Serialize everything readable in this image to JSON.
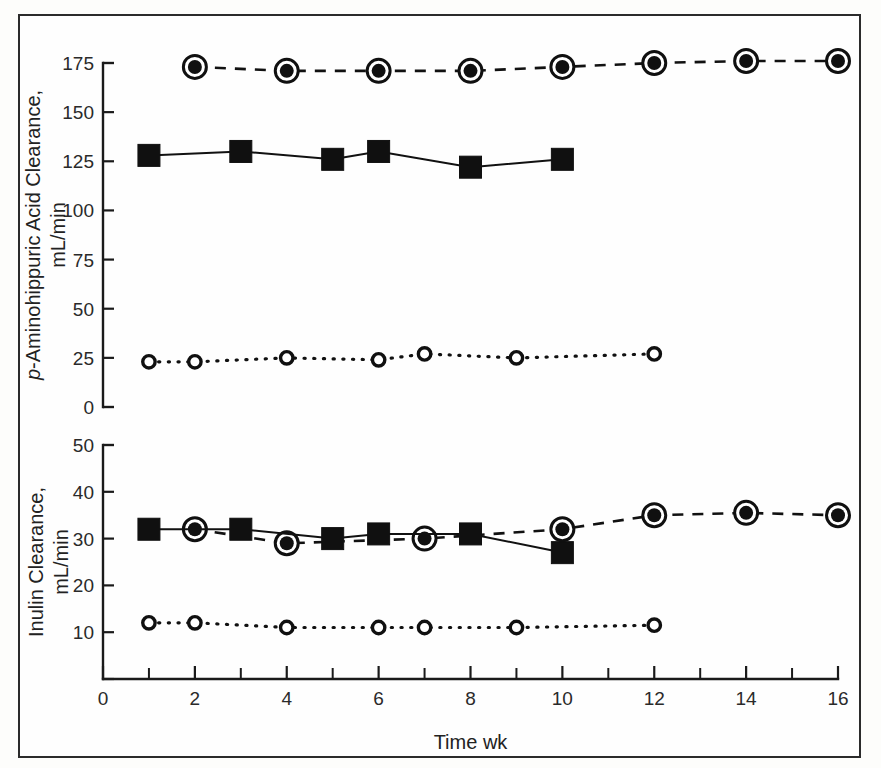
{
  "figure": {
    "border_color": "#2b2b2b",
    "background": "#fefefe",
    "ink_color": "#111111"
  },
  "xaxis": {
    "label": "Time wk",
    "ticks": [
      0,
      2,
      4,
      6,
      8,
      10,
      12,
      14,
      16
    ],
    "tick_labels": [
      "0",
      "2",
      "4",
      "6",
      "8",
      "10",
      "12",
      "14",
      "16"
    ],
    "minor_ticks": [
      1,
      3,
      5,
      7,
      9,
      11,
      13,
      15
    ],
    "range": [
      0,
      16
    ]
  },
  "chart_data": [
    {
      "type": "line",
      "panel": "top",
      "title": "",
      "xlabel": "Time wk",
      "ylabel": "p-Aminohippuric Acid Clearance, mL/min",
      "ylabel_line1_italic_prefix": "p",
      "ylabel_line1": "-Aminohippuric Acid Clearance,",
      "ylabel_line2": "mL/min",
      "xlim": [
        0,
        16
      ],
      "ylim": [
        0,
        175
      ],
      "yticks": [
        0,
        25,
        50,
        75,
        100,
        125,
        150,
        175
      ],
      "ytick_labels": [
        "0",
        "25",
        "50",
        "75",
        "100",
        "125",
        "150",
        "175"
      ],
      "grid": false,
      "legend": "none",
      "series": [
        {
          "name": "bullseye-dashed-series",
          "marker": "circle-filled-ringed",
          "linestyle": "dashed",
          "x": [
            2,
            4,
            6,
            8,
            10,
            12,
            14,
            16
          ],
          "y": [
            173,
            171,
            171,
            171,
            173,
            175,
            176,
            176
          ]
        },
        {
          "name": "filled-square-solid-series",
          "marker": "square-filled",
          "linestyle": "solid",
          "x": [
            1,
            3,
            5,
            6,
            8,
            10
          ],
          "y": [
            128,
            130,
            126,
            130,
            122,
            126
          ]
        },
        {
          "name": "open-circle-dotted-series",
          "marker": "circle-open",
          "linestyle": "dotted",
          "x": [
            1,
            2,
            4,
            6,
            7,
            9,
            12
          ],
          "y": [
            23,
            23,
            25,
            24,
            27,
            25,
            27
          ]
        }
      ]
    },
    {
      "type": "line",
      "panel": "bottom",
      "title": "",
      "xlabel": "Time wk",
      "ylabel": "Inulin Clearance, mL/min",
      "ylabel_line1": "Inulin Clearance,",
      "ylabel_line2": "mL/min",
      "xlim": [
        0,
        16
      ],
      "ylim": [
        0,
        50
      ],
      "yticks": [
        10,
        20,
        30,
        40,
        50
      ],
      "ytick_labels": [
        "10",
        "20",
        "30",
        "40",
        "50"
      ],
      "grid": false,
      "legend": "none",
      "series": [
        {
          "name": "bullseye-dashed-series",
          "marker": "circle-filled-ringed",
          "linestyle": "dashed",
          "x": [
            2,
            4,
            7,
            10,
            12,
            14,
            16
          ],
          "y": [
            32,
            29,
            30,
            32,
            35,
            35.5,
            35
          ]
        },
        {
          "name": "filled-square-solid-series",
          "marker": "square-filled",
          "linestyle": "solid",
          "x": [
            1,
            3,
            5,
            6,
            8,
            10
          ],
          "y": [
            32,
            32,
            30,
            31,
            31,
            27
          ]
        },
        {
          "name": "open-circle-dotted-series",
          "marker": "circle-open",
          "linestyle": "dotted",
          "x": [
            1,
            2,
            4,
            6,
            7,
            9,
            12
          ],
          "y": [
            12,
            12,
            11,
            11,
            11,
            11,
            11.5
          ]
        }
      ]
    }
  ]
}
